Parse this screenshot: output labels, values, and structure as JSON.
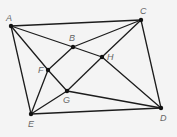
{
  "diagram": {
    "type": "geometry-figure",
    "points": [
      {
        "id": "A",
        "label": "A",
        "x": 11,
        "y": 26,
        "lx": 6,
        "ly": 21
      },
      {
        "id": "B",
        "label": "B",
        "x": 73,
        "y": 47,
        "lx": 69,
        "ly": 41
      },
      {
        "id": "C",
        "label": "C",
        "x": 141,
        "y": 20,
        "lx": 140,
        "ly": 14
      },
      {
        "id": "D",
        "label": "D",
        "x": 161,
        "y": 108,
        "lx": 160,
        "ly": 121
      },
      {
        "id": "E",
        "label": "E",
        "x": 31,
        "y": 114,
        "lx": 28,
        "ly": 127
      },
      {
        "id": "F",
        "label": "F",
        "x": 48,
        "y": 70,
        "lx": 38,
        "ly": 73
      },
      {
        "id": "G",
        "label": "G",
        "x": 67,
        "y": 91,
        "lx": 63,
        "ly": 103
      },
      {
        "id": "H",
        "label": "H",
        "x": 102,
        "y": 57,
        "lx": 107,
        "ly": 60
      }
    ],
    "segments": [
      [
        "A",
        "C"
      ],
      [
        "C",
        "D"
      ],
      [
        "D",
        "E"
      ],
      [
        "E",
        "A"
      ],
      [
        "A",
        "F"
      ],
      [
        "F",
        "G"
      ],
      [
        "G",
        "D"
      ],
      [
        "A",
        "B"
      ],
      [
        "B",
        "H"
      ],
      [
        "H",
        "D"
      ],
      [
        "E",
        "F"
      ],
      [
        "F",
        "B"
      ],
      [
        "B",
        "C"
      ],
      [
        "E",
        "G"
      ],
      [
        "G",
        "H"
      ],
      [
        "H",
        "C"
      ]
    ],
    "colors": {
      "line": "#1c1c1c",
      "point": "#111111",
      "label": "#666666",
      "background": "#f4f4f4"
    }
  }
}
